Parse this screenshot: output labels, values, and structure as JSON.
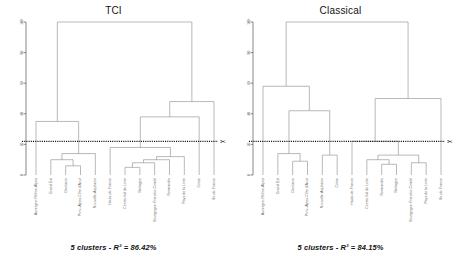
{
  "figure": {
    "panels": [
      {
        "key": "tci",
        "title": "TCI",
        "caption": "5 clusters - R² = 86.42%",
        "axis": {
          "ticks": [
            "100",
            "80",
            "60",
            "40",
            "20",
            "0"
          ],
          "min": 0,
          "max": 100
        },
        "cut_height": 22,
        "scissors_icon": "✂",
        "leaves": [
          "Auvergne-Rhône-Alpes",
          "Grand Est",
          "Occitanie",
          "Prov.-Alpes-Côte d'Azur",
          "Nouvelle-Aquitaine",
          "Hauts-de-France",
          "Centre-Val de Loire",
          "Bretagne",
          "Bourgogne-Franche-Comté",
          "Normandie",
          "Pays de la Loire",
          "Corse",
          "Île-de-France"
        ]
      },
      {
        "key": "classical",
        "title": "Classical",
        "caption": "5 clusters - R² = 84.15%",
        "axis": {
          "ticks": [
            "100",
            "80",
            "60",
            "40",
            "20",
            "0"
          ],
          "min": 0,
          "max": 100
        },
        "cut_height": 22,
        "scissors_icon": "✂",
        "leaves": [
          "Auvergne-Rhône-Alpes",
          "Grand Est",
          "Occitanie",
          "Prov.-Alpes-Côte d'Azur",
          "Nouvelle-Aquitaine",
          "Corse",
          "Hauts-de-France",
          "Centre-Val de Loire",
          "Normandie",
          "Bretagne",
          "Bourgogne-Franche-Comté",
          "Pays de la Loire",
          "Île-de-France"
        ]
      }
    ]
  },
  "chart_data": [
    {
      "type": "dendrogram",
      "title": "TCI",
      "subtitle": "5 clusters - R² = 86.42%",
      "xlabel": "",
      "ylabel": "",
      "ylim": [
        0,
        100
      ],
      "yticks": [
        0,
        20,
        40,
        60,
        80,
        100
      ],
      "grid": false,
      "legend": "none",
      "n_clusters": 5,
      "r_squared": 86.42,
      "cut_height": 22,
      "leaf_order": [
        "Auvergne-Rhône-Alpes",
        "Grand Est",
        "Occitanie",
        "Prov.-Alpes-Côte d'Azur",
        "Nouvelle-Aquitaine",
        "Hauts-de-France",
        "Centre-Val de Loire",
        "Bretagne",
        "Bourgogne-Franche-Comté",
        "Normandie",
        "Pays de la Loire",
        "Corse",
        "Île-de-France"
      ],
      "merges": [
        {
          "id": "m1",
          "left": "Occitanie",
          "right": "Prov.-Alpes-Côte d'Azur",
          "height": 6
        },
        {
          "id": "m2",
          "left": "Grand Est",
          "right": "m1",
          "height": 10
        },
        {
          "id": "m3",
          "left": "m2",
          "right": "Nouvelle-Aquitaine",
          "height": 14
        },
        {
          "id": "m4",
          "left": "Auvergne-Rhône-Alpes",
          "right": "m3",
          "height": 35
        },
        {
          "id": "m5",
          "left": "Centre-Val de Loire",
          "right": "Bretagne",
          "height": 5
        },
        {
          "id": "m6",
          "left": "m5",
          "right": "Bourgogne-Franche-Comté",
          "height": 8
        },
        {
          "id": "m7",
          "left": "m6",
          "right": "Normandie",
          "height": 10
        },
        {
          "id": "m8",
          "left": "m7",
          "right": "Pays de la Loire",
          "height": 12
        },
        {
          "id": "m9",
          "left": "Hauts-de-France",
          "right": "m8",
          "height": 18
        },
        {
          "id": "m10",
          "left": "m9",
          "right": "Corse",
          "height": 38
        },
        {
          "id": "m11",
          "left": "m10",
          "right": "Île-de-France",
          "height": 48
        },
        {
          "id": "m12",
          "left": "m4",
          "right": "m11",
          "height": 100
        }
      ]
    },
    {
      "type": "dendrogram",
      "title": "Classical",
      "subtitle": "5 clusters - R² = 84.15%",
      "xlabel": "",
      "ylabel": "",
      "ylim": [
        0,
        100
      ],
      "yticks": [
        0,
        20,
        40,
        60,
        80,
        100
      ],
      "grid": false,
      "legend": "none",
      "n_clusters": 5,
      "r_squared": 84.15,
      "cut_height": 22,
      "leaf_order": [
        "Auvergne-Rhône-Alpes",
        "Grand Est",
        "Occitanie",
        "Prov.-Alpes-Côte d'Azur",
        "Nouvelle-Aquitaine",
        "Corse",
        "Hauts-de-France",
        "Centre-Val de Loire",
        "Normandie",
        "Bretagne",
        "Bourgogne-Franche-Comté",
        "Pays de la Loire",
        "Île-de-France"
      ],
      "merges": [
        {
          "id": "c1",
          "left": "Occitanie",
          "right": "Prov.-Alpes-Côte d'Azur",
          "height": 9
        },
        {
          "id": "c2",
          "left": "Grand Est",
          "right": "c1",
          "height": 14
        },
        {
          "id": "c3",
          "left": "Nouvelle-Aquitaine",
          "right": "Corse",
          "height": 13
        },
        {
          "id": "c4",
          "left": "c2",
          "right": "c3",
          "height": 42
        },
        {
          "id": "c5",
          "left": "Auvergne-Rhône-Alpes",
          "right": "c4",
          "height": 58
        },
        {
          "id": "c6",
          "left": "Normandie",
          "right": "Bretagne",
          "height": 7
        },
        {
          "id": "c7",
          "left": "Centre-Val de Loire",
          "right": "c6",
          "height": 10
        },
        {
          "id": "c8",
          "left": "Bourgogne-Franche-Comté",
          "right": "Pays de la Loire",
          "height": 8
        },
        {
          "id": "c9",
          "left": "c7",
          "right": "c8",
          "height": 13
        },
        {
          "id": "c10",
          "left": "Hauts-de-France",
          "right": "c9",
          "height": 22
        },
        {
          "id": "c11",
          "left": "c10",
          "right": "Île-de-France",
          "height": 50
        },
        {
          "id": "c12",
          "left": "c5",
          "right": "c11",
          "height": 100
        }
      ]
    }
  ]
}
